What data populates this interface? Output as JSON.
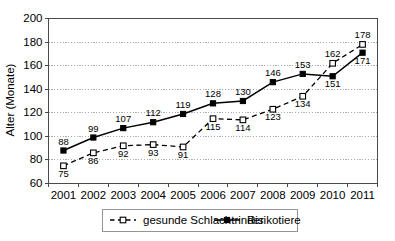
{
  "chart_data": {
    "type": "line",
    "title": "",
    "subtitle": "",
    "xlabel": "",
    "ylabel": "Alter (Monate)",
    "categories": [
      "2001",
      "2002",
      "2003",
      "2004",
      "2005",
      "2006",
      "2007",
      "2008",
      "2009",
      "2010",
      "2011"
    ],
    "ylim": [
      60,
      200
    ],
    "yticks": [
      60,
      80,
      100,
      120,
      140,
      160,
      180,
      200
    ],
    "grid": "horizontal-dotted",
    "legend_position": "bottom",
    "series": [
      {
        "name": "gesunde Schlachtrinder",
        "marker": "open-square",
        "line_style": "dashed",
        "color": "#000000",
        "values": [
          75,
          86,
          92,
          93,
          91,
          115,
          114,
          123,
          134,
          162,
          178
        ],
        "label_positions": [
          "below",
          "below",
          "below",
          "below",
          "below",
          "below",
          "below",
          "below",
          "below",
          "above",
          "above"
        ]
      },
      {
        "name": "Risikotiere",
        "marker": "filled-square",
        "line_style": "solid",
        "color": "#000000",
        "values": [
          88,
          99,
          107,
          112,
          119,
          128,
          130,
          146,
          153,
          151,
          171
        ],
        "label_positions": [
          "above",
          "above",
          "above",
          "above",
          "above",
          "above",
          "above",
          "above",
          "above",
          "below",
          "below"
        ]
      }
    ]
  },
  "axes": {
    "y_title": "Alter (Monate)",
    "y_tick_labels": [
      "200",
      "180",
      "160",
      "140",
      "120",
      "100",
      "80",
      "60"
    ],
    "x_tick_labels": [
      "2001",
      "2002",
      "2003",
      "2004",
      "2005",
      "2006",
      "2007",
      "2008",
      "2009",
      "2010",
      "2011"
    ]
  },
  "legend": {
    "items": [
      {
        "label": "gesunde Schlachtrinder",
        "marker": "open-square",
        "line_style": "dashed"
      },
      {
        "label": "Risikotiere",
        "marker": "filled-square",
        "line_style": "solid"
      }
    ]
  },
  "colors": {
    "axis": "#4a4a4a",
    "grid": "#9a9a9a",
    "series": "#000000",
    "background": "#ffffff",
    "legend_border": "#8a8a8a"
  }
}
